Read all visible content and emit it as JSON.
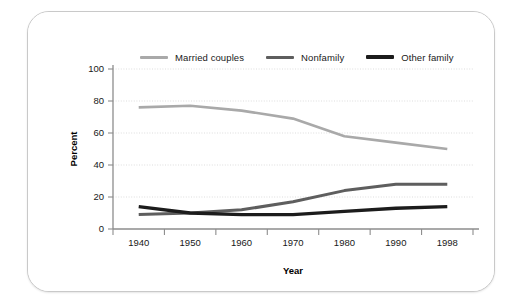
{
  "chart_data": {
    "type": "line",
    "title": "",
    "xlabel": "Year",
    "ylabel": "Percent",
    "categories": [
      "1940",
      "1950",
      "1960",
      "1970",
      "1980",
      "1990",
      "1998"
    ],
    "x": [
      1940,
      1950,
      1960,
      1970,
      1980,
      1990,
      1998
    ],
    "xlim": [
      1940,
      1998
    ],
    "ylim": [
      0,
      100
    ],
    "yticks": [
      0,
      20,
      40,
      60,
      80,
      100
    ],
    "ytick_labels": [
      "0",
      "20",
      "40",
      "60",
      "80",
      "100"
    ],
    "grid": "horizontal-dotted",
    "legend_position": "top",
    "series": [
      {
        "name": "Married couples",
        "color": "#a9a9a9",
        "width": 2.6,
        "values": [
          76,
          77,
          74,
          69,
          58,
          54,
          50
        ]
      },
      {
        "name": "Nonfamily",
        "color": "#5e5e5e",
        "width": 3.0,
        "values": [
          9,
          10,
          12,
          17,
          24,
          28,
          28
        ]
      },
      {
        "name": "Other family",
        "color": "#1c1c1c",
        "width": 3.4,
        "values": [
          14,
          10,
          9,
          9,
          11,
          13,
          14
        ]
      }
    ]
  },
  "legend": {
    "items": [
      {
        "label": "Married couples",
        "color": "#a9a9a9"
      },
      {
        "label": "Nonfamily",
        "color": "#5e5e5e"
      },
      {
        "label": "Other family",
        "color": "#1c1c1c"
      }
    ]
  },
  "axes": {
    "y_title": "Percent",
    "x_title": "Year",
    "y_labels": [
      "100",
      "80",
      "60",
      "40",
      "20",
      "0"
    ],
    "x_labels": [
      "1940",
      "1950",
      "1960",
      "1970",
      "1980",
      "1990",
      "1998"
    ]
  }
}
